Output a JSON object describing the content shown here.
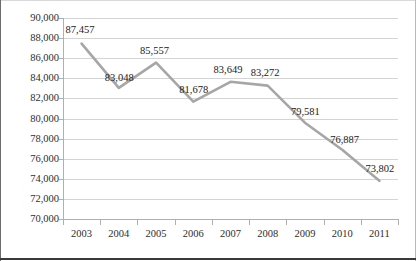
{
  "chart_data": {
    "type": "line",
    "title": "",
    "subtitle": "",
    "xlabel": "",
    "ylabel": "",
    "categories": [
      "2003",
      "2004",
      "2005",
      "2006",
      "2007",
      "2008",
      "2009",
      "2010",
      "2011"
    ],
    "values": [
      87457,
      83048,
      85557,
      81678,
      83649,
      83272,
      79581,
      76887,
      73802
    ],
    "data_labels": [
      "87,457",
      "83,048",
      "85,557",
      "81,678",
      "83,649",
      "83,272",
      "79,581",
      "76,887",
      "73,802"
    ],
    "series": [
      {
        "name": "",
        "values": [
          87457,
          83048,
          85557,
          81678,
          83649,
          83272,
          79581,
          76887,
          73802
        ]
      }
    ],
    "ylim": [
      70000,
      90000
    ],
    "ytick_values": [
      90000,
      88000,
      86000,
      84000,
      82000,
      80000,
      78000,
      76000,
      74000,
      72000,
      70000
    ],
    "ytick_labels": [
      "90,000",
      "88,000",
      "86,000",
      "84,000",
      "82,000",
      "80,000",
      "78,000",
      "76,000",
      "74,000",
      "72,000",
      "70,000"
    ],
    "grid": true,
    "legend": false,
    "legend_position": "none",
    "line_color": "#a6a6a6",
    "grid_color": "#d4d4d4",
    "axis_color": "#b0b0b0",
    "text_color": "#2d2d2d"
  }
}
